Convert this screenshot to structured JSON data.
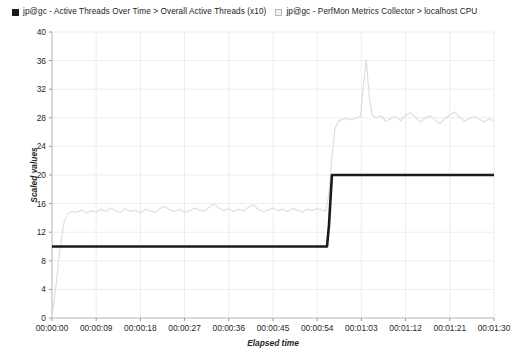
{
  "legend": {
    "entries": [
      {
        "marker": "filled-square-icon",
        "label": "jp@gc - Active Threads Over Time > Overall Active Threads (x10)",
        "color": "#1a1a1a"
      },
      {
        "marker": "hollow-square-icon",
        "label": "jp@gc - PerfMon Metrics Collector > localhost CPU",
        "color": "#d6d6d6"
      }
    ]
  },
  "chart_data": {
    "type": "line",
    "title": "",
    "xlabel": "Elapsed time",
    "ylabel": "Scaled values",
    "grid": true,
    "legend_position": "top",
    "ylim": [
      0,
      40
    ],
    "yticks": [
      0,
      4,
      8,
      12,
      16,
      20,
      24,
      28,
      32,
      36,
      40
    ],
    "ytick_labels": [
      "0",
      "4",
      "8",
      "12",
      "16",
      "20",
      "24",
      "28",
      "32",
      "36",
      "40"
    ],
    "xlim": [
      0,
      90
    ],
    "xticks": [
      0,
      9,
      18,
      27,
      36,
      45,
      54,
      63,
      72,
      81,
      90
    ],
    "xtick_labels": [
      "00:00:00",
      "00:00:09",
      "00:00:18",
      "00:00:27",
      "00:00:36",
      "00:00:45",
      "00:00:54",
      "00:01:03",
      "00:01:12",
      "00:01:21",
      "00:01:30"
    ],
    "series": [
      {
        "name": "jp@gc - Active Threads Over Time > Overall Active Threads (x10)",
        "color": "#1a1a1a",
        "width": 2.6,
        "x": [
          0,
          1,
          3,
          6,
          9,
          12,
          15,
          18,
          21,
          24,
          27,
          30,
          33,
          36,
          39,
          42,
          45,
          48,
          51,
          54,
          56,
          56.4,
          57,
          58,
          60,
          63,
          66,
          69,
          72,
          75,
          78,
          81,
          84,
          87,
          90
        ],
        "values": [
          10,
          10,
          10,
          10,
          10,
          10,
          10,
          10,
          10,
          10,
          10,
          10,
          10,
          10,
          10,
          10,
          10,
          10,
          10,
          10,
          10,
          13,
          20,
          20,
          20,
          20,
          20,
          20,
          20,
          20,
          20,
          20,
          20,
          20,
          20
        ]
      },
      {
        "name": "jp@gc - PerfMon Metrics Collector > localhost CPU",
        "color": "#dcdcdc",
        "width": 1.1,
        "x": [
          0,
          0.8,
          1.6,
          2.4,
          3.2,
          4,
          5,
          6,
          7,
          8,
          9,
          10,
          11,
          12,
          13,
          14,
          15,
          16,
          17,
          18,
          19,
          20,
          21,
          22,
          23,
          24,
          25,
          26,
          27,
          28,
          29,
          30,
          31,
          32,
          33,
          34,
          35,
          36,
          37,
          38,
          39,
          40,
          41,
          42,
          43,
          44,
          45,
          46,
          47,
          48,
          49,
          50,
          51,
          52,
          53,
          54,
          55,
          55.8,
          56.4,
          57,
          57.6,
          58.4,
          59.2,
          60,
          61,
          62,
          62.8,
          63.4,
          64,
          64.6,
          65.2,
          66,
          67,
          68,
          69,
          70,
          71,
          72,
          73,
          74,
          75,
          76,
          77,
          78,
          79,
          80,
          81,
          82,
          83,
          84,
          85,
          86,
          87,
          88,
          89,
          90
        ],
        "values": [
          0,
          4.5,
          9.5,
          13.2,
          14.6,
          14.9,
          14.8,
          15.1,
          14.7,
          15.0,
          14.8,
          15.2,
          14.9,
          15.4,
          15.0,
          14.8,
          15.3,
          14.9,
          15.1,
          14.7,
          15.2,
          15.0,
          14.8,
          15.3,
          15.6,
          15.1,
          14.9,
          15.2,
          14.8,
          15.0,
          15.4,
          15.1,
          14.9,
          15.5,
          16.0,
          15.4,
          15.0,
          15.3,
          14.9,
          15.2,
          15.0,
          15.5,
          15.8,
          15.2,
          14.9,
          15.1,
          15.4,
          15.0,
          15.2,
          14.9,
          15.3,
          15.1,
          14.8,
          15.2,
          15.0,
          15.3,
          15.1,
          15.0,
          17.5,
          22.5,
          26.5,
          27.6,
          27.8,
          27.9,
          27.7,
          28.0,
          28.2,
          32.5,
          36.1,
          31.0,
          28.4,
          28.0,
          28.3,
          27.5,
          27.9,
          28.2,
          27.6,
          28.4,
          28.7,
          28.1,
          27.4,
          28.0,
          28.3,
          27.7,
          27.2,
          27.9,
          28.4,
          28.8,
          28.1,
          27.5,
          27.9,
          28.2,
          27.8,
          27.4,
          27.9,
          27.6
        ]
      }
    ]
  }
}
